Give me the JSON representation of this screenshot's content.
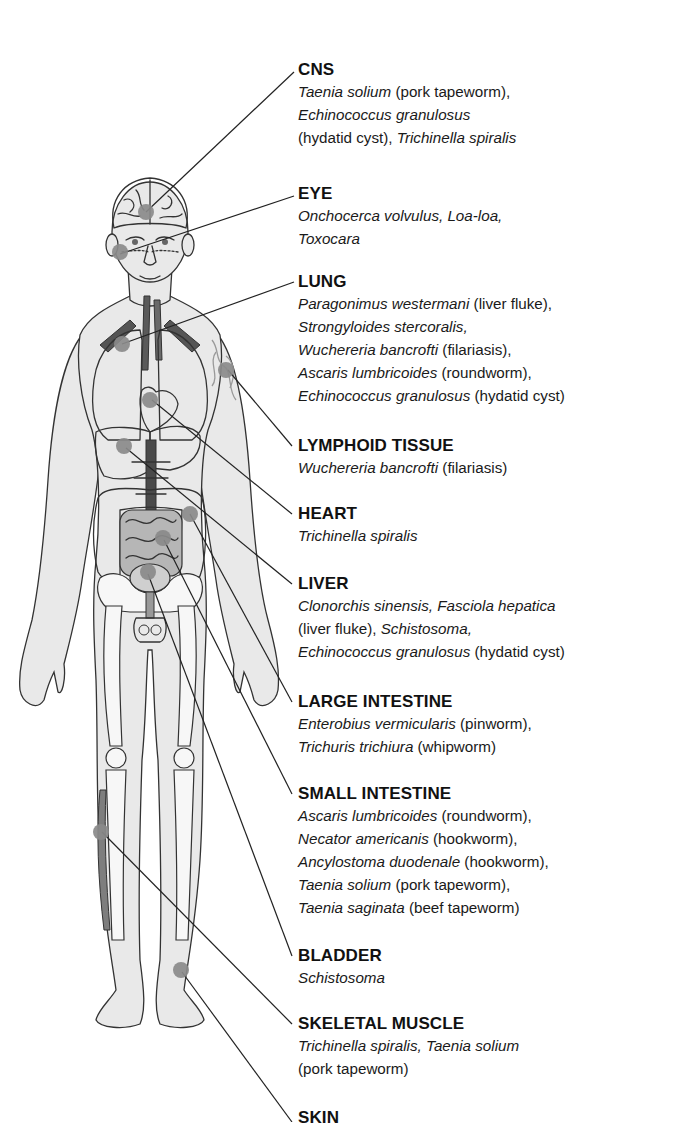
{
  "colors": {
    "text": "#111111",
    "marker_dot": "#8a8a8a",
    "organ_dark": "#7c7c7c",
    "organ_mid": "#a8a8a8",
    "skin_fill": "#e9e9e9",
    "leader_line": "#222222"
  },
  "labels": [
    {
      "id": "cns",
      "title": "CNS",
      "lines": [
        [
          {
            "t": "Taenia solium",
            "i": true
          },
          {
            "t": " (pork tapeworm),",
            "i": false
          }
        ],
        [
          {
            "t": "Echinococcus granulosus",
            "i": true
          }
        ],
        [
          {
            "t": "(hydatid cyst), ",
            "i": false
          },
          {
            "t": "Trichinella spiralis",
            "i": true
          }
        ]
      ]
    },
    {
      "id": "eye",
      "title": "EYE",
      "lines": [
        [
          {
            "t": "Onchocerca volvulus, Loa-loa,",
            "i": true
          }
        ],
        [
          {
            "t": "Toxocara",
            "i": true
          }
        ]
      ]
    },
    {
      "id": "lung",
      "title": "LUNG",
      "lines": [
        [
          {
            "t": "Paragonimus westermani",
            "i": true
          },
          {
            "t": " (liver fluke),",
            "i": false
          }
        ],
        [
          {
            "t": "Strongyloides stercoralis,",
            "i": true
          }
        ],
        [
          {
            "t": "Wuchereria bancrofti",
            "i": true
          },
          {
            "t": " (filariasis),",
            "i": false
          }
        ],
        [
          {
            "t": "Ascaris lumbricoides",
            "i": true
          },
          {
            "t": " (roundworm),",
            "i": false
          }
        ],
        [
          {
            "t": "Echinococcus granulosus",
            "i": true
          },
          {
            "t": " (hydatid cyst)",
            "i": false
          }
        ]
      ]
    },
    {
      "id": "lymphoid-tissue",
      "title": "LYMPHOID TISSUE",
      "lines": [
        [
          {
            "t": "Wuchereria bancrofti",
            "i": true
          },
          {
            "t": " (filariasis)",
            "i": false
          }
        ]
      ]
    },
    {
      "id": "heart",
      "title": "HEART",
      "lines": [
        [
          {
            "t": "Trichinella spiralis",
            "i": true
          }
        ]
      ]
    },
    {
      "id": "liver",
      "title": "LIVER",
      "lines": [
        [
          {
            "t": "Clonorchis sinensis, Fasciola hepatica",
            "i": true
          }
        ],
        [
          {
            "t": "(liver fluke), ",
            "i": false
          },
          {
            "t": "Schistosoma,",
            "i": true
          }
        ],
        [
          {
            "t": "Echinococcus granulosus",
            "i": true
          },
          {
            "t": " (hydatid cyst)",
            "i": false
          }
        ]
      ]
    },
    {
      "id": "large-intestine",
      "title": "LARGE INTESTINE",
      "lines": [
        [
          {
            "t": "Enterobius vermicularis",
            "i": true
          },
          {
            "t": " (pinworm),",
            "i": false
          }
        ],
        [
          {
            "t": "Trichuris trichiura",
            "i": true
          },
          {
            "t": " (whipworm)",
            "i": false
          }
        ]
      ]
    },
    {
      "id": "small-intestine",
      "title": "SMALL INTESTINE",
      "lines": [
        [
          {
            "t": "Ascaris lumbricoides",
            "i": true
          },
          {
            "t": " (roundworm),",
            "i": false
          }
        ],
        [
          {
            "t": "Necator americanis",
            "i": true
          },
          {
            "t": " (hookworm),",
            "i": false
          }
        ],
        [
          {
            "t": "Ancylostoma duodenale",
            "i": true
          },
          {
            "t": " (hookworm),",
            "i": false
          }
        ],
        [
          {
            "t": "Taenia solium",
            "i": true
          },
          {
            "t": " (pork tapeworm),",
            "i": false
          }
        ],
        [
          {
            "t": "Taenia saginata",
            "i": true
          },
          {
            "t": " (beef tapeworm)",
            "i": false
          }
        ]
      ]
    },
    {
      "id": "bladder",
      "title": "BLADDER",
      "lines": [
        [
          {
            "t": "Schistosoma",
            "i": true
          }
        ]
      ]
    },
    {
      "id": "skeletal-muscle",
      "title": "SKELETAL MUSCLE",
      "lines": [
        [
          {
            "t": "Trichinella spiralis, Taenia solium",
            "i": true
          }
        ],
        [
          {
            "t": "(pork tapeworm)",
            "i": false
          }
        ]
      ]
    },
    {
      "id": "skin",
      "title": "SKIN",
      "lines": []
    }
  ]
}
